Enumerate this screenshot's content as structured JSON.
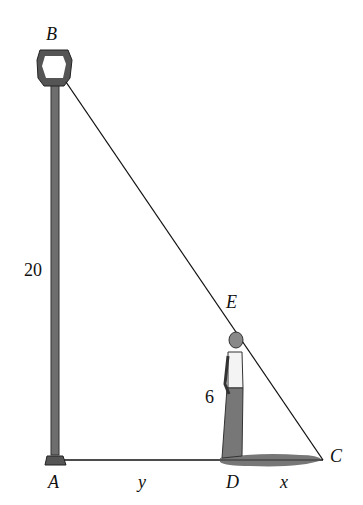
{
  "diagram": {
    "type": "similar-triangles lamp post",
    "labels": {
      "B": "B",
      "A": "A",
      "E": "E",
      "D": "D",
      "C": "C",
      "pole_height": "20",
      "person_height": "6",
      "AD": "y",
      "DC": "x"
    },
    "colors": {
      "line": "#111111",
      "pole": "#6e6e6e",
      "shadow": "#555555"
    }
  }
}
